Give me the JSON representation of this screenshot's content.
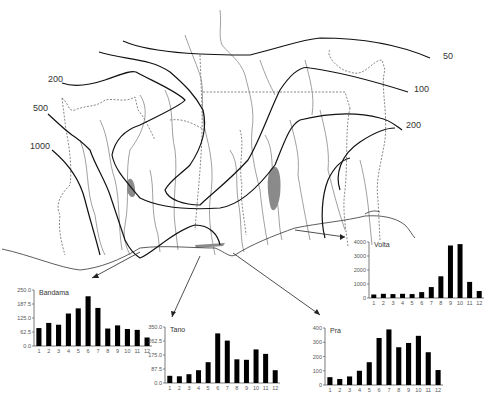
{
  "map": {
    "isohyet_labels": [
      {
        "text": "50",
        "x": 443,
        "y": 57
      },
      {
        "text": "100",
        "x": 414,
        "y": 90
      },
      {
        "text": "200",
        "x": 406,
        "y": 126
      },
      {
        "text": "200",
        "x": 48,
        "y": 80
      },
      {
        "text": "500",
        "x": 33,
        "y": 109
      },
      {
        "text": "1000",
        "x": 30,
        "y": 147
      }
    ]
  },
  "chart_data": [
    {
      "type": "bar",
      "title": "Bandama",
      "categories": [
        "1",
        "2",
        "3",
        "4",
        "5",
        "6",
        "7",
        "8",
        "9",
        "10",
        "11",
        "12"
      ],
      "values": [
        80,
        103,
        95,
        145,
        168,
        222,
        170,
        78,
        92,
        76,
        72,
        38
      ],
      "yticks": [
        "0.0",
        "62.5",
        "125.0",
        "187.5",
        "250.0"
      ],
      "ylim": [
        0,
        250
      ],
      "xlabel": "",
      "ylabel": "",
      "grid": false
    },
    {
      "type": "bar",
      "title": "Tano",
      "categories": [
        "1",
        "2",
        "3",
        "4",
        "5",
        "6",
        "7",
        "8",
        "9",
        "10",
        "11",
        "12"
      ],
      "values": [
        45,
        42,
        55,
        80,
        130,
        310,
        265,
        148,
        145,
        210,
        182,
        80
      ],
      "yticks": [
        "0.0",
        "87.5",
        "175.0",
        "262.5",
        "350.0"
      ],
      "ylim": [
        0,
        350
      ],
      "xlabel": "",
      "ylabel": "",
      "grid": false
    },
    {
      "type": "bar",
      "title": "Pra",
      "categories": [
        "1",
        "2",
        "3",
        "4",
        "5",
        "6",
        "7",
        "8",
        "9",
        "10",
        "11",
        "12"
      ],
      "values": [
        55,
        42,
        60,
        100,
        160,
        330,
        390,
        265,
        295,
        345,
        230,
        105
      ],
      "yticks": [
        "0",
        "100",
        "200",
        "300",
        "400"
      ],
      "ylim": [
        0,
        400
      ],
      "xlabel": "",
      "ylabel": "",
      "grid": false
    },
    {
      "type": "bar",
      "title": "Volta",
      "categories": [
        "1",
        "2",
        "3",
        "4",
        "5",
        "6",
        "7",
        "8",
        "9",
        "10",
        "11",
        "12"
      ],
      "values": [
        250,
        300,
        280,
        300,
        280,
        420,
        780,
        1550,
        3750,
        3850,
        1150,
        500
      ],
      "yticks": [
        "0",
        "1000",
        "2000",
        "3000",
        "4000"
      ],
      "ylim": [
        0,
        4000
      ],
      "xlabel": "",
      "ylabel": "",
      "grid": false
    }
  ],
  "charts_layout": [
    {
      "left": 34,
      "top": 290,
      "plot_w": 118,
      "plot_h": 56
    },
    {
      "left": 165,
      "top": 327,
      "plot_w": 115,
      "plot_h": 56
    },
    {
      "left": 325,
      "top": 328,
      "plot_w": 118,
      "plot_h": 57
    },
    {
      "left": 369,
      "top": 242,
      "plot_w": 115,
      "plot_h": 56
    }
  ]
}
